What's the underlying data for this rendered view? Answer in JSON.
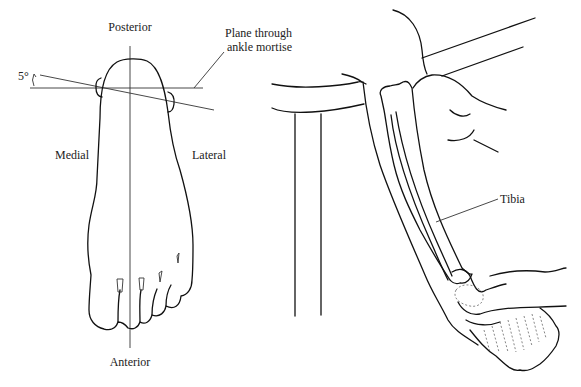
{
  "figure": {
    "left_panel": {
      "labels": {
        "posterior": "Posterior",
        "anterior": "Anterior",
        "medial": "Medial",
        "lateral": "Lateral",
        "plane_line1": "Plane through",
        "plane_line2": "ankle mortise",
        "angle": "5°"
      }
    },
    "right_panel": {
      "labels": {
        "tibia": "Tibia"
      }
    }
  }
}
